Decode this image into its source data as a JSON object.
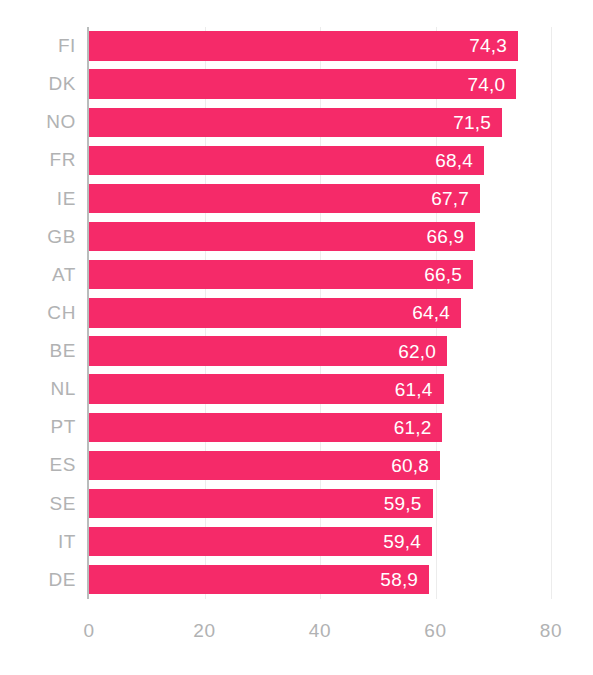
{
  "chart_data": {
    "type": "bar",
    "orientation": "horizontal",
    "title": "",
    "subtitle": "",
    "xlabel": "",
    "ylabel": "",
    "xlim": [
      0,
      80
    ],
    "xticks": [
      "0",
      "20",
      "40",
      "60",
      "80"
    ],
    "xtick_values": [
      0,
      20,
      40,
      60,
      80
    ],
    "grid": "vertical-light",
    "legend": "none",
    "decimal_separator": ",",
    "bar_color": "#f52a69",
    "label_color": "#b1b2b3",
    "value_label_color": "#ffffff",
    "axis_color": "#b9bcbc",
    "gridline_color": "#ececec",
    "categories": [
      "FI",
      "DK",
      "NO",
      "FR",
      "IE",
      "GB",
      "AT",
      "CH",
      "BE",
      "NL",
      "PT",
      "ES",
      "SE",
      "IT",
      "DE"
    ],
    "values": [
      74.3,
      74.0,
      71.5,
      68.4,
      67.7,
      66.9,
      66.5,
      64.4,
      62.0,
      61.4,
      61.2,
      60.8,
      59.5,
      59.4,
      58.9
    ],
    "value_labels": [
      "74,3",
      "74,0",
      "71,5",
      "68,4",
      "67,7",
      "66,9",
      "66,5",
      "64,4",
      "62,0",
      "61,4",
      "61,2",
      "60,8",
      "59,5",
      "59,4",
      "58,9"
    ],
    "bars": [
      {
        "category": "FI",
        "value": 74.3,
        "label": "74,3"
      },
      {
        "category": "DK",
        "value": 74.0,
        "label": "74,0"
      },
      {
        "category": "NO",
        "value": 71.5,
        "label": "71,5"
      },
      {
        "category": "FR",
        "value": 68.4,
        "label": "68,4"
      },
      {
        "category": "IE",
        "value": 67.7,
        "label": "67,7"
      },
      {
        "category": "GB",
        "value": 66.9,
        "label": "66,9"
      },
      {
        "category": "AT",
        "value": 66.5,
        "label": "66,5"
      },
      {
        "category": "CH",
        "value": 64.4,
        "label": "64,4"
      },
      {
        "category": "BE",
        "value": 62.0,
        "label": "62,0"
      },
      {
        "category": "NL",
        "value": 61.4,
        "label": "61,4"
      },
      {
        "category": "PT",
        "value": 61.2,
        "label": "61,2"
      },
      {
        "category": "ES",
        "value": 60.8,
        "label": "60,8"
      },
      {
        "category": "SE",
        "value": 59.5,
        "label": "59,5"
      },
      {
        "category": "IT",
        "value": 59.4,
        "label": "59,4"
      },
      {
        "category": "DE",
        "value": 58.9,
        "label": "58,9"
      }
    ]
  }
}
